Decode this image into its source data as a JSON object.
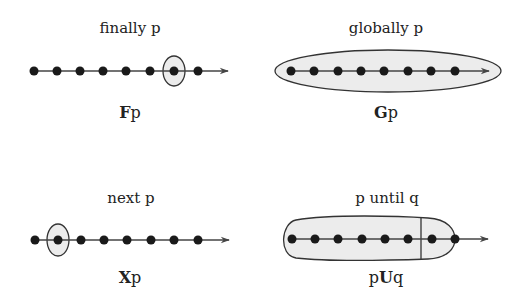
{
  "panels": [
    {
      "id": "finally",
      "title": "finally p",
      "formula_op": "F",
      "formula_arg": "p"
    },
    {
      "id": "globally",
      "title": "globally p",
      "formula_op": "G",
      "formula_arg": "p"
    },
    {
      "id": "next",
      "title": "next p",
      "formula_op": "X",
      "formula_arg": "p"
    },
    {
      "id": "until",
      "title": "p until q",
      "formula_pre": "p",
      "formula_op": "U",
      "formula_arg": "q"
    }
  ],
  "colors": {
    "ink": "#222222",
    "highlight_fill": "#ececec",
    "background": "#ffffff"
  },
  "states_per_timeline": 8
}
